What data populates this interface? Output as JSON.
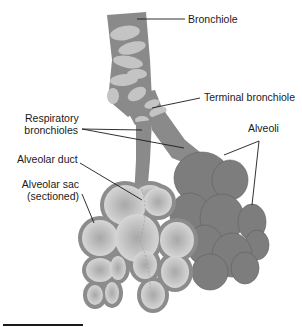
{
  "diagram": {
    "colors": {
      "airway": "#8a8a8a",
      "cartilage": "#c4c4c4",
      "alveoli_dark": "#7d7d7d",
      "alveoli_outline": "#6a6a6a",
      "sac_fill": "#d2d2d2",
      "sac_rim": "#8c8c8c",
      "leader_line": "#1a1a1a"
    },
    "labels": {
      "bronchiole": "Bronchiole",
      "terminal_bronchiole": "Terminal bronchiole",
      "respiratory_bronchioles_1": "Respiratory",
      "respiratory_bronchioles_2": "bronchioles",
      "alveoli": "Alveoli",
      "alveolar_duct": "Alveolar duct",
      "alveolar_sac_1": "Alveolar sac",
      "alveolar_sac_2": "(sectioned)"
    }
  }
}
